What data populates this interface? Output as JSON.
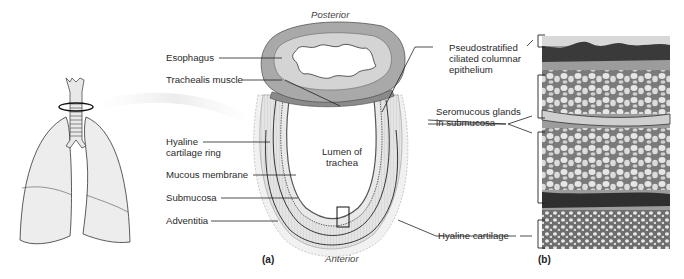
{
  "figure": {
    "panel_a_label": "(a)",
    "panel_b_label": "(b)",
    "orientation": {
      "top": "Posterior",
      "bottom": "Anterior"
    },
    "lumen_label": [
      "Lumen of",
      "trachea"
    ]
  },
  "left_labels": [
    {
      "id": "esophagus",
      "text": "Esophagus"
    },
    {
      "id": "trachealis-muscle",
      "text": "Trachealis muscle"
    },
    {
      "id": "hyaline-cartilage-ring",
      "lines": [
        "Hyaline",
        "cartilage ring"
      ]
    },
    {
      "id": "mucous-membrane",
      "text": "Mucous membrane"
    },
    {
      "id": "submucosa",
      "text": "Submucosa"
    },
    {
      "id": "adventitia",
      "text": "Adventitia"
    }
  ],
  "right_labels": [
    {
      "id": "pseudostratified-epithelium",
      "lines": [
        "Pseudostratified",
        "ciliated columnar",
        "epithelium"
      ]
    },
    {
      "id": "seromucous-glands",
      "lines": [
        "Seromucous glands",
        "in submucosa"
      ]
    },
    {
      "id": "hyaline-cartilage",
      "text": "Hyaline cartilage"
    }
  ],
  "colors": {
    "esophagus_outer": "#a9a9a9",
    "esophagus_inner": "#d4d4d4",
    "cartilage_fill": "#e2e2e2",
    "lung_fill": "#ededed",
    "micrograph_dark": "#3a3a3a",
    "micrograph_light": "#d8d8d8"
  }
}
